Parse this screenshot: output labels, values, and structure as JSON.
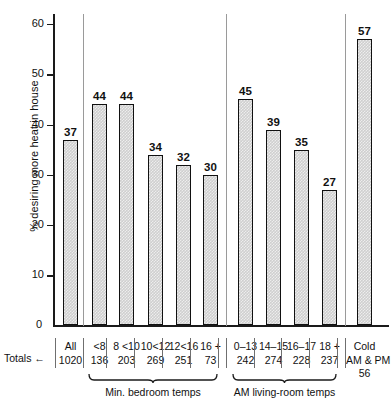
{
  "chart_data": {
    "type": "bar",
    "title": "",
    "ylabel": "% desiring more heat in house",
    "xlabel": "",
    "ylim": [
      0,
      62
    ],
    "yticks": [
      0,
      10,
      20,
      30,
      40,
      50,
      60
    ],
    "grid": false,
    "legend": null,
    "totals_label": "Totals",
    "totals_arrow": "←",
    "categories": [
      "All",
      "<8",
      "8 <10",
      "10<12",
      "12<16",
      "16 +",
      "0–13",
      "14–15",
      "16–17",
      "18 +",
      "Cold AM & PM"
    ],
    "values": [
      37,
      44,
      44,
      34,
      32,
      30,
      45,
      39,
      35,
      27,
      57
    ],
    "totals": [
      1020,
      136,
      203,
      269,
      251,
      73,
      242,
      274,
      228,
      237,
      56
    ],
    "groups": [
      {
        "name": "",
        "label": "",
        "categories": [
          "All"
        ]
      },
      {
        "name": "min-bedroom-temps",
        "label": "Min. bedroom temps",
        "categories": [
          "<8",
          "8 <10",
          "10<12",
          "12<16",
          "16 +"
        ]
      },
      {
        "name": "am-living-room-temps",
        "label": "AM living-room temps",
        "categories": [
          "0–13",
          "14–15",
          "16–17",
          "18 +"
        ]
      },
      {
        "name": "cold",
        "label": "",
        "categories": [
          "Cold AM & PM"
        ]
      }
    ],
    "bars": [
      {
        "cat": "All",
        "cat2": "",
        "value": 37,
        "total": 1020
      },
      {
        "cat": "<8",
        "cat2": "",
        "value": 44,
        "total": 136
      },
      {
        "cat": "8 <10",
        "cat2": "",
        "value": 44,
        "total": 203
      },
      {
        "cat": "10<12",
        "cat2": "",
        "value": 34,
        "total": 269
      },
      {
        "cat": "12<16",
        "cat2": "",
        "value": 32,
        "total": 251
      },
      {
        "cat": "16 +",
        "cat2": "",
        "value": 30,
        "total": 73
      },
      {
        "cat": "0–13",
        "cat2": "",
        "value": 45,
        "total": 242
      },
      {
        "cat": "14–15",
        "cat2": "",
        "value": 39,
        "total": 274
      },
      {
        "cat": "16–17",
        "cat2": "",
        "value": 35,
        "total": 228
      },
      {
        "cat": "18 +",
        "cat2": "",
        "value": 27,
        "total": 237
      },
      {
        "cat": "Cold",
        "cat2": "AM & PM",
        "value": 57,
        "total": 56
      }
    ]
  }
}
